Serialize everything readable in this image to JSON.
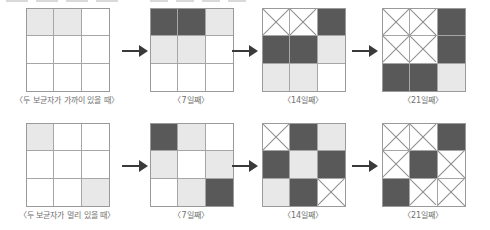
{
  "figure": {
    "title": "",
    "colors": {
      "dark_cell": "#595959",
      "light_cell": "#e8e8e8",
      "white_cell": "#ffffff",
      "grid_line": "#a6a6a6",
      "grid_border": "#9a9a9a",
      "cross_line": "#8d8d8d",
      "arrow": "#3a3a3a",
      "caption_text": "#6f6f6f"
    },
    "grid_size": {
      "rows": 3,
      "cols": 3
    },
    "legend_states": {
      "white": "감염되지 않은 칸",
      "light": "감염된 칸",
      "dark": "감염이 심한 칸",
      "cross": "소멸된 칸"
    },
    "arrow_glyph": "arrow-right",
    "rows": [
      {
        "name": "두 보균자가 가까이 있을 때",
        "stages": [
          {
            "caption": "〈두 보균자가 가까이 있을 때〉",
            "cells": [
              "light",
              "light",
              "white",
              "white",
              "white",
              "white",
              "white",
              "white",
              "white"
            ]
          },
          {
            "caption": "〈7일째〉",
            "cells": [
              "dark",
              "dark",
              "light",
              "light",
              "light",
              "white",
              "white",
              "white",
              "white"
            ]
          },
          {
            "caption": "〈14일째〉",
            "cells": [
              "cross",
              "cross",
              "dark",
              "dark",
              "dark",
              "light",
              "light",
              "light",
              "white"
            ]
          },
          {
            "caption": "〈21일째〉",
            "cells": [
              "cross",
              "cross",
              "dark",
              "cross",
              "cross",
              "dark",
              "dark",
              "dark",
              "light"
            ]
          }
        ]
      },
      {
        "name": "두 보균자가 멀리 있을 때",
        "stages": [
          {
            "caption": "〈두 보균자가 멀리 있을 때〉",
            "cells": [
              "light",
              "white",
              "white",
              "white",
              "white",
              "white",
              "white",
              "white",
              "light"
            ]
          },
          {
            "caption": "〈7일째〉",
            "cells": [
              "dark",
              "light",
              "white",
              "light",
              "white",
              "light",
              "white",
              "light",
              "dark"
            ]
          },
          {
            "caption": "〈14일째〉",
            "cells": [
              "cross",
              "dark",
              "light",
              "dark",
              "light",
              "dark",
              "light",
              "dark",
              "cross"
            ]
          },
          {
            "caption": "〈21일째〉",
            "cells": [
              "cross",
              "cross",
              "dark",
              "cross",
              "dark",
              "cross",
              "dark",
              "cross",
              "cross"
            ]
          }
        ]
      }
    ]
  }
}
